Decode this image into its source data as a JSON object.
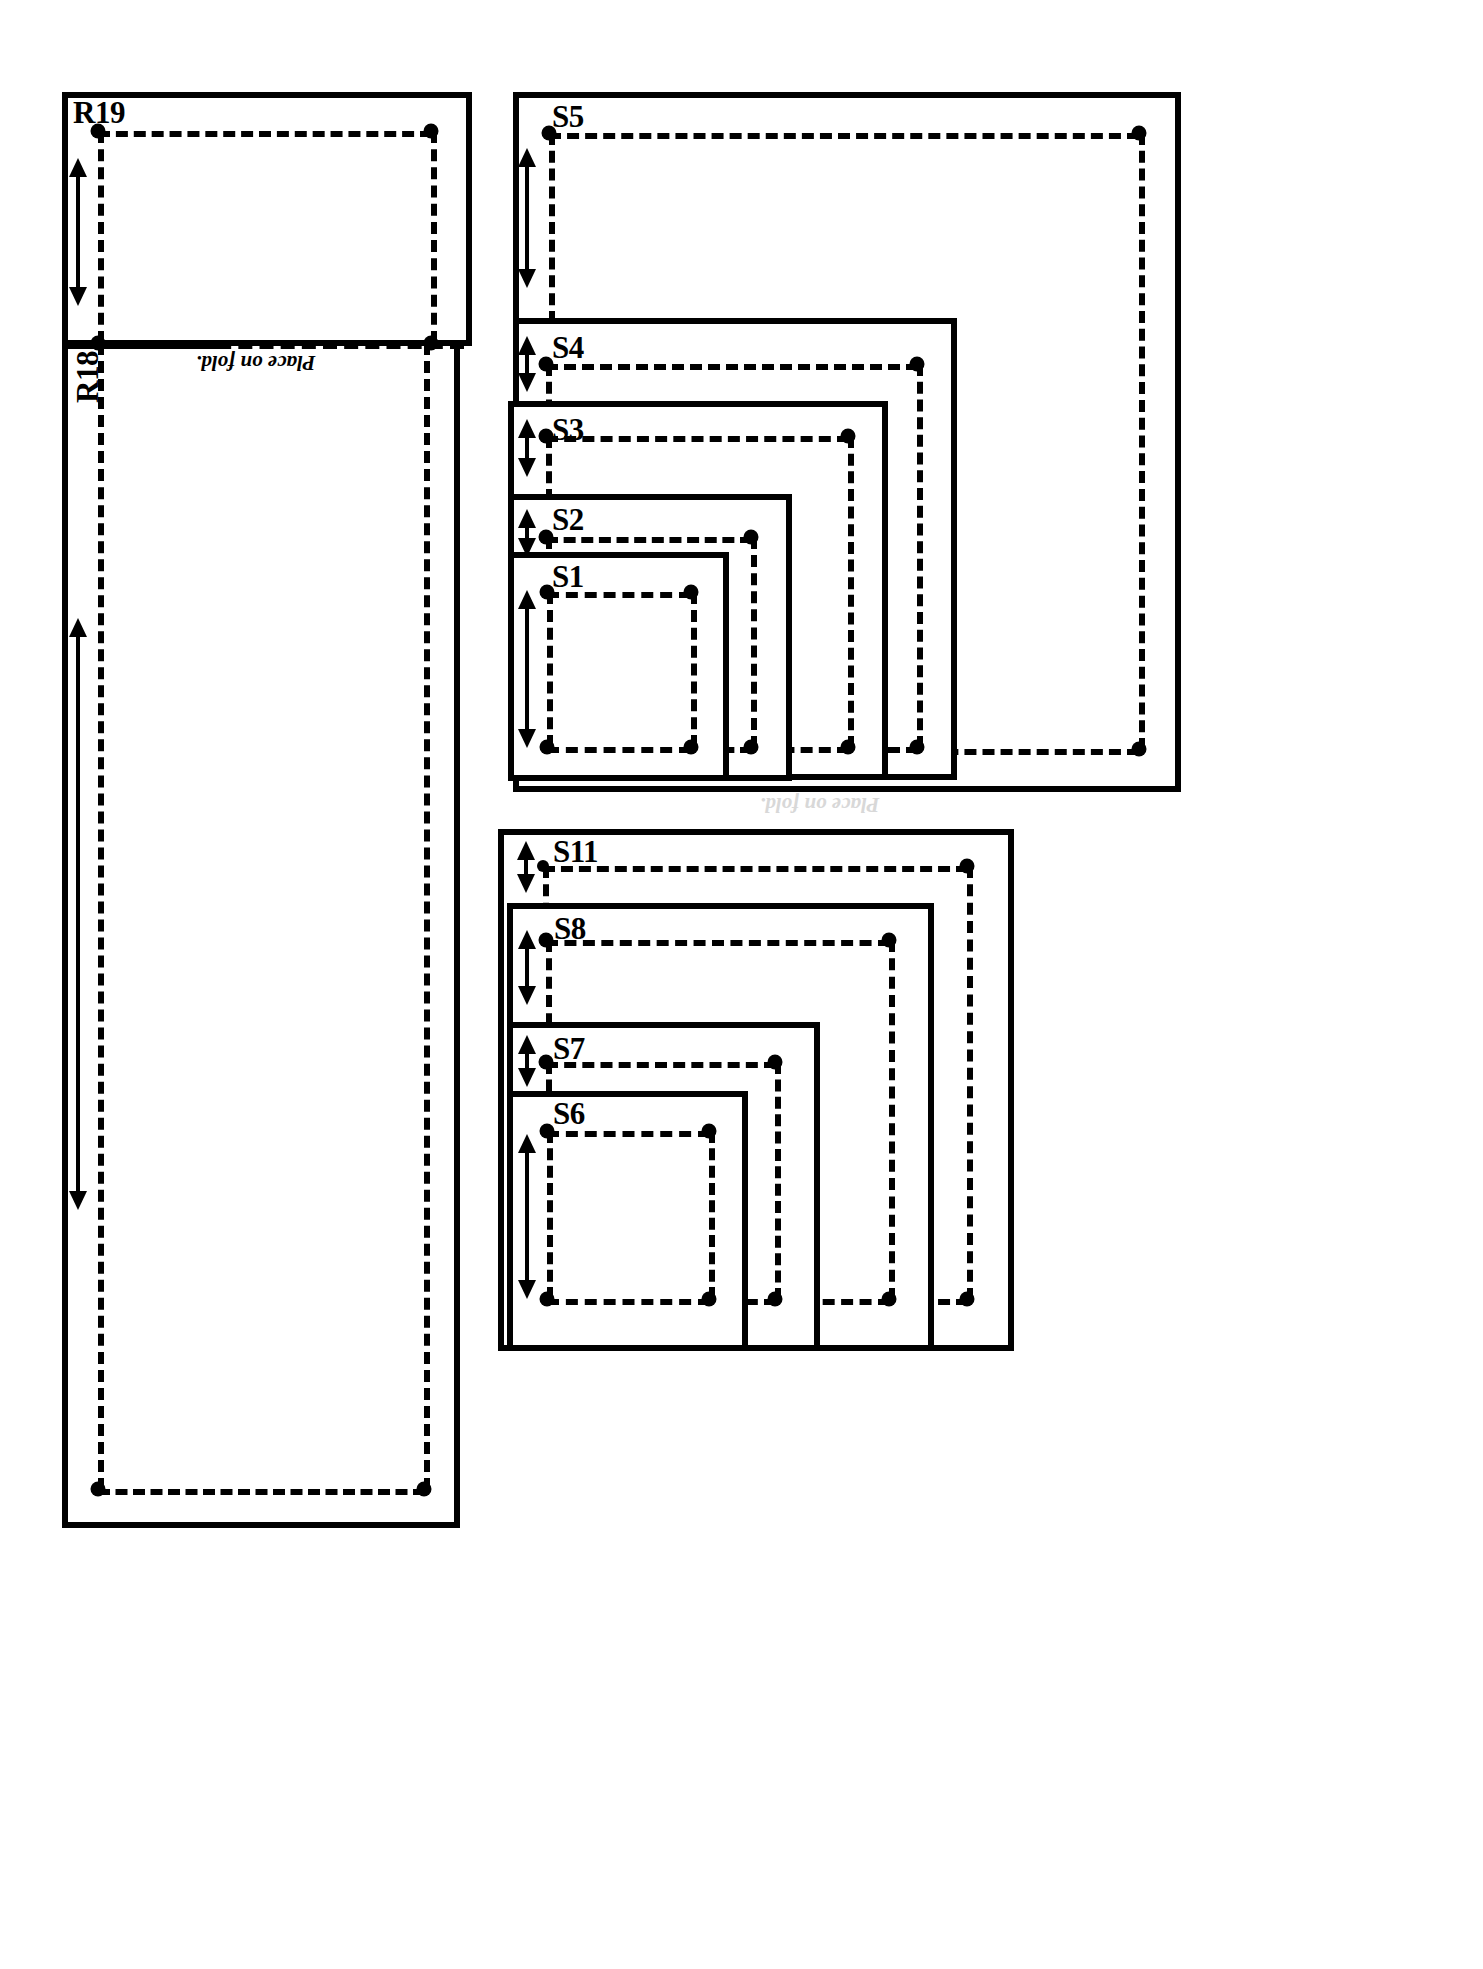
{
  "document": {
    "type": "sewing-pattern-sheet",
    "title": "Pattern piece layout sheet",
    "background_color": "#ffffff",
    "ink_color": "#000000"
  },
  "fold_caption": {
    "text": "Place on fold.",
    "ghost_text": "Place on fold."
  },
  "left_panel": {
    "name": "fold-panel",
    "pieces": [
      {
        "id": "R19",
        "label": "R19",
        "section": "upper",
        "grainline": "double-arrow",
        "has_fold_edge": true
      },
      {
        "id": "R18",
        "label": "R18",
        "section": "lower",
        "label_orientation": "vertical",
        "grainline": "double-arrow",
        "has_fold_edge": true
      }
    ]
  },
  "upper_group": {
    "name": "nested-square-group-upper",
    "pieces": [
      {
        "id": "S5",
        "label": "S5",
        "grainline": "double-arrow"
      },
      {
        "id": "S4",
        "label": "S4",
        "grainline": "double-arrow"
      },
      {
        "id": "S3",
        "label": "S3",
        "grainline": "double-arrow"
      },
      {
        "id": "S2",
        "label": "S2",
        "grainline": "double-arrow"
      },
      {
        "id": "S1",
        "label": "S1",
        "grainline": "double-arrow"
      }
    ]
  },
  "lower_group": {
    "name": "nested-square-group-lower",
    "pieces": [
      {
        "id": "S11",
        "label": "S11",
        "grainline": "double-arrow"
      },
      {
        "id": "S8",
        "label": "S8",
        "grainline": "double-arrow"
      },
      {
        "id": "S7",
        "label": "S7",
        "grainline": "double-arrow"
      },
      {
        "id": "S6",
        "label": "S6",
        "grainline": "double-arrow"
      }
    ]
  },
  "legend": {
    "solid_line_meaning": "cutting line",
    "dashed_line_meaning": "stitching line",
    "dot_meaning": "corner match point",
    "arrow_meaning": "grainline"
  }
}
